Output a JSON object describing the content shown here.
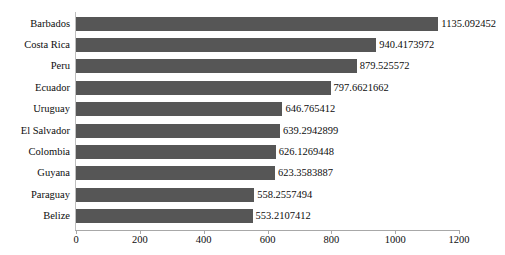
{
  "chart_data": {
    "type": "bar",
    "orientation": "horizontal",
    "title": "",
    "subtitle": "",
    "xlabel": "",
    "ylabel": "",
    "xlim": [
      0,
      1200
    ],
    "xticks": [
      "0",
      "200",
      "400",
      "600",
      "800",
      "1000",
      "1200"
    ],
    "xtick_values": [
      0,
      200,
      400,
      600,
      800,
      1000,
      1200
    ],
    "grid": false,
    "legend": false,
    "bar_color": "#565656",
    "axis_color": "#a8a8a8",
    "categories": [
      "Barbados",
      "Costa Rica",
      "Peru",
      "Ecuador",
      "Uruguay",
      "El Salvador",
      "Colombia",
      "Guyana",
      "Paraguay",
      "Belize"
    ],
    "values": [
      1135.092452,
      940.4173972,
      879.525572,
      797.6621662,
      646.765412,
      639.2942899,
      626.1269448,
      623.3583887,
      558.2557494,
      553.2107412
    ],
    "data_labels": [
      "1135.092452",
      "940.4173972",
      "879.525572",
      "797.6621662",
      "646.765412",
      "639.2942899",
      "626.1269448",
      "623.3583887",
      "558.2557494",
      "553.2107412"
    ]
  }
}
